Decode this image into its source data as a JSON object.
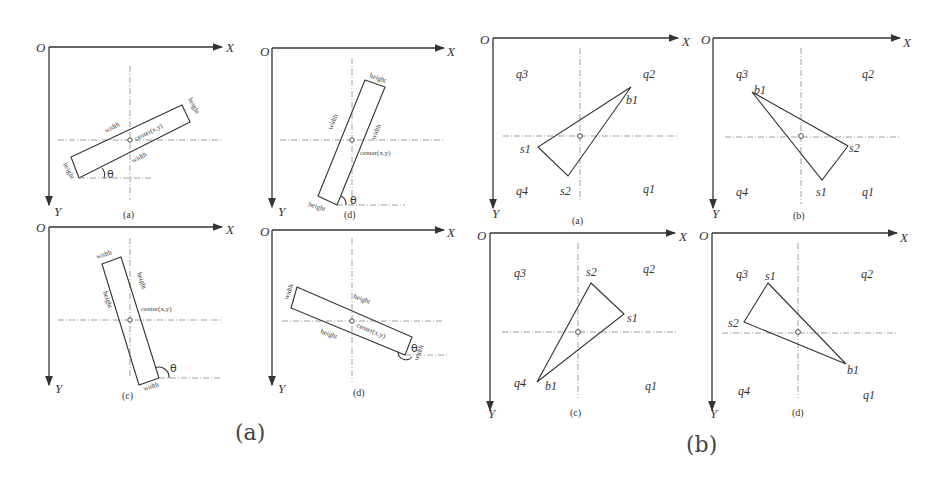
{
  "figure": {
    "group_a": {
      "label": "(a)",
      "panels": [
        {
          "caption": "(a)",
          "origin": "O",
          "x_axis": "X",
          "y_axis": "Y",
          "labels": {
            "width_top": "width",
            "width_bottom": "width",
            "height_right": "height",
            "height_left": "height",
            "center": "center(x,y)",
            "angle": "θ"
          }
        },
        {
          "caption": "(d)",
          "origin": "O",
          "x_axis": "X",
          "y_axis": "Y",
          "labels": {
            "width_left": "width",
            "width_right": "width",
            "height_top": "height",
            "height_bottom": "height",
            "center": "center(x,y)",
            "angle": "θ"
          }
        },
        {
          "caption": "(c)",
          "origin": "O",
          "x_axis": "X",
          "y_axis": "Y",
          "labels": {
            "width_top": "width",
            "width_bottom": "width",
            "height_left": "height",
            "height_right": "height",
            "center": "center(x,y)",
            "angle": "θ"
          }
        },
        {
          "caption": "(d)",
          "origin": "O",
          "x_axis": "X",
          "y_axis": "Y",
          "labels": {
            "width_left": "width",
            "width_right": "width",
            "height_top": "height",
            "height_bottom": "height",
            "center": "center(x,y)",
            "angle": "θ"
          }
        }
      ]
    },
    "group_b": {
      "label": "(b)",
      "panels": [
        {
          "caption": "(a)",
          "origin": "O",
          "x_axis": "X",
          "y_axis": "Y",
          "quadrants": {
            "q1": "q1",
            "q2": "q2",
            "q3": "q3",
            "q4": "q4"
          },
          "vertices": {
            "s1": "s1",
            "s2": "s2",
            "b1": "b1"
          }
        },
        {
          "caption": "(b)",
          "origin": "O",
          "x_axis": "X",
          "y_axis": "Y",
          "quadrants": {
            "q1": "q1",
            "q2": "q2",
            "q3": "q3",
            "q4": "q4"
          },
          "vertices": {
            "s1": "s1",
            "s2": "s2",
            "b1": "b1"
          }
        },
        {
          "caption": "(c)",
          "origin": "O",
          "x_axis": "X",
          "y_axis": "Y",
          "quadrants": {
            "q1": "q1",
            "q2": "q2",
            "q3": "q3",
            "q4": "q4"
          },
          "vertices": {
            "s1": "s1",
            "s2": "s2",
            "b1": "b1"
          }
        },
        {
          "caption": "(d)",
          "origin": "O",
          "x_axis": "X",
          "y_axis": "Y",
          "quadrants": {
            "q1": "q1",
            "q2": "q2",
            "q3": "q3",
            "q4": "q4"
          },
          "vertices": {
            "s1": "s1",
            "s2": "s2",
            "b1": "b1"
          }
        }
      ]
    }
  }
}
